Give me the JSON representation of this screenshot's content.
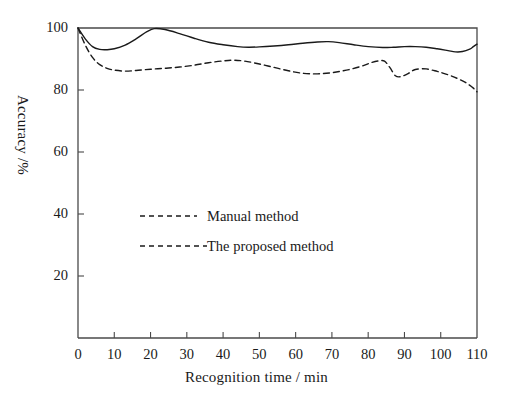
{
  "chart_data": {
    "type": "line",
    "title": "",
    "xlabel": "Recognition time / min",
    "ylabel": "Accuracy /%",
    "xlim": [
      0,
      110
    ],
    "ylim": [
      0,
      100
    ],
    "xticks": [
      0,
      10,
      20,
      30,
      40,
      50,
      60,
      70,
      80,
      90,
      100,
      110
    ],
    "yticks": [
      20,
      40,
      60,
      80,
      100
    ],
    "grid": false,
    "legend_position": "center-left",
    "series": [
      {
        "name": "Manual method",
        "style": "dashed",
        "color": "#1a1a1a",
        "x": [
          0,
          2,
          4,
          6,
          8,
          10,
          13,
          16,
          20,
          24,
          28,
          32,
          36,
          40,
          43,
          46,
          50,
          54,
          58,
          62,
          66,
          70,
          74,
          78,
          81,
          83,
          84.5,
          86,
          87.5,
          89,
          91,
          93,
          96,
          99,
          101,
          103,
          105,
          107,
          109,
          110
        ],
        "y": [
          100,
          94.5,
          90.5,
          88.2,
          87.0,
          86.4,
          86.1,
          86.3,
          86.7,
          87.0,
          87.4,
          88.0,
          88.8,
          89.4,
          89.6,
          89.3,
          88.4,
          87.3,
          86.2,
          85.4,
          85.2,
          85.6,
          86.4,
          87.6,
          88.9,
          89.4,
          89.3,
          87.2,
          84.6,
          84.3,
          85.3,
          86.6,
          86.8,
          86.0,
          85.3,
          84.5,
          83.5,
          82.3,
          80.6,
          79.4
        ]
      },
      {
        "name": "The proposed method",
        "style": "solid",
        "color": "#1a1a1a",
        "x": [
          0,
          2,
          4,
          6,
          8,
          10,
          13,
          16,
          19,
          21,
          24,
          28,
          32,
          36,
          40,
          44,
          47,
          50,
          54,
          58,
          62,
          66,
          69,
          72,
          76,
          80,
          84,
          87,
          90,
          93,
          96,
          99,
          102,
          104,
          106,
          108,
          109,
          110
        ],
        "y": [
          100,
          96.5,
          94.0,
          93.1,
          93.0,
          93.3,
          94.5,
          96.5,
          98.8,
          99.8,
          99.5,
          98.2,
          96.7,
          95.4,
          94.6,
          94.0,
          93.8,
          93.9,
          94.2,
          94.6,
          95.1,
          95.5,
          95.6,
          95.3,
          94.6,
          94.0,
          93.7,
          93.8,
          94.0,
          94.0,
          93.8,
          93.3,
          92.7,
          92.3,
          92.4,
          93.2,
          94.0,
          94.8
        ]
      }
    ]
  },
  "legend": {
    "entries": [
      {
        "label": "Manual method",
        "dash": "dashed"
      },
      {
        "label": "The proposed method",
        "dash": "dashed"
      }
    ]
  },
  "axis": {
    "x_label": "Recognition time / min",
    "y_label": "Accuracy /%",
    "x_ticks": [
      "0",
      "10",
      "20",
      "30",
      "40",
      "50",
      "60",
      "70",
      "80",
      "90",
      "100",
      "110"
    ],
    "y_ticks": [
      "100",
      "80",
      "60",
      "40",
      "20"
    ]
  },
  "colors": {
    "axis": "#4a4a4a",
    "line": "#1a1a1a",
    "background": "#ffffff"
  }
}
